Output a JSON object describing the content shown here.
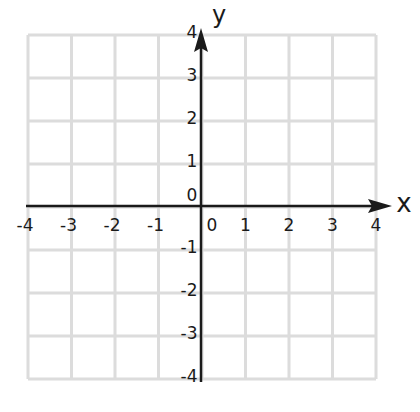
{
  "chart_data": {
    "type": "coordinate-grid",
    "title": "",
    "xlabel": "x",
    "ylabel": "y",
    "xlim": [
      -4,
      4
    ],
    "ylim": [
      -4,
      4
    ],
    "grid": true,
    "x_ticks": [
      -4,
      -3,
      -2,
      -1,
      0,
      1,
      2,
      3,
      4
    ],
    "y_ticks": [
      -4,
      -3,
      -2,
      -1,
      0,
      1,
      2,
      3,
      4
    ],
    "x_tick_labels": [
      "-4",
      "-3",
      "-2",
      "-1",
      "0",
      "1",
      "2",
      "3",
      "4"
    ],
    "y_tick_labels": [
      "-4",
      "-3",
      "-2",
      "-1",
      "0",
      "1",
      "2",
      "3",
      "4"
    ],
    "series": [],
    "grid_color": "#dcdcdc",
    "axis_color": "#1a1a1a"
  },
  "axes": {
    "x_name": "x",
    "y_name": "y",
    "origin_label_x": "0",
    "origin_label_y": "0"
  }
}
